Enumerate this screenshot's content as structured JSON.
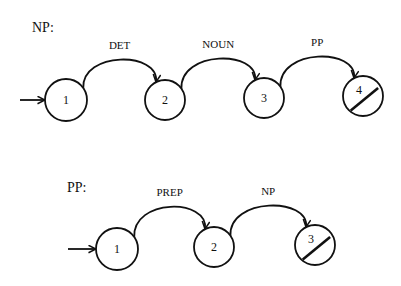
{
  "networks": [
    {
      "title": "NP:",
      "title_pos": [
        32,
        32
      ],
      "entry_arrow": {
        "x1": 20,
        "y1": 100,
        "x2": 45,
        "y2": 100
      },
      "nodes": [
        {
          "label": "1",
          "cx": 66,
          "cy": 100,
          "r": 21,
          "final": false
        },
        {
          "label": "2",
          "cx": 165,
          "cy": 100,
          "r": 20,
          "final": false
        },
        {
          "label": "3",
          "cx": 264,
          "cy": 98,
          "r": 20,
          "final": false
        },
        {
          "label": "4",
          "cx": 363,
          "cy": 96,
          "r": 20,
          "final": true
        }
      ],
      "arcs": [
        {
          "label": "DET",
          "from": 0,
          "to": 1
        },
        {
          "label": "NOUN",
          "from": 1,
          "to": 2
        },
        {
          "label": "PP",
          "from": 2,
          "to": 3
        }
      ]
    },
    {
      "title": "PP:",
      "title_pos": [
        67,
        192
      ],
      "entry_arrow": {
        "x1": 68,
        "y1": 249,
        "x2": 96,
        "y2": 249
      },
      "nodes": [
        {
          "label": "1",
          "cx": 117,
          "cy": 249,
          "r": 21,
          "final": false
        },
        {
          "label": "2",
          "cx": 214,
          "cy": 247,
          "r": 20,
          "final": false
        },
        {
          "label": "3",
          "cx": 315,
          "cy": 245,
          "r": 20,
          "final": true
        }
      ],
      "arcs": [
        {
          "label": "PREP",
          "from": 0,
          "to": 1
        },
        {
          "label": "NP",
          "from": 1,
          "to": 2
        }
      ]
    }
  ],
  "colors": {
    "stroke": "#111111",
    "background": "#ffffff"
  }
}
